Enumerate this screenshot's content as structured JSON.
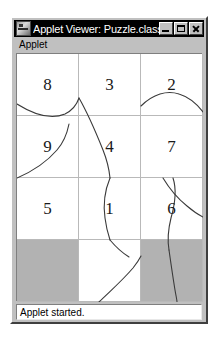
{
  "window": {
    "title": "Applet Viewer: Puzzle.class",
    "icon": "applet-viewer-icon",
    "buttons": {
      "minimize": "minimize-icon",
      "maximize": "maximize-icon",
      "close": "close-icon"
    }
  },
  "menubar": {
    "items": [
      {
        "label": "Applet"
      }
    ]
  },
  "applet": {
    "grid": {
      "columns": 3,
      "rows": 4,
      "cells": [
        {
          "label": "8",
          "style": "white"
        },
        {
          "label": "3",
          "style": "white"
        },
        {
          "label": "2",
          "style": "white"
        },
        {
          "label": "9",
          "style": "white"
        },
        {
          "label": "4",
          "style": "white"
        },
        {
          "label": "7",
          "style": "white"
        },
        {
          "label": "5",
          "style": "white"
        },
        {
          "label": "1",
          "style": "white"
        },
        {
          "label": "6",
          "style": "white"
        },
        {
          "label": "",
          "style": "gray"
        },
        {
          "label": "",
          "style": "white"
        },
        {
          "label": "",
          "style": "gray"
        }
      ]
    }
  },
  "statusbar": {
    "text": "Applet started."
  },
  "colors": {
    "titlebar_background": "#000000",
    "titlebar_text": "#ffffff",
    "window_face": "#c0c0c0",
    "canvas_background": "#ffffff",
    "grid_line": "#b9b9b9",
    "blank_tile": "#b2b2b2",
    "curve_stroke": "#3a3a3a"
  }
}
